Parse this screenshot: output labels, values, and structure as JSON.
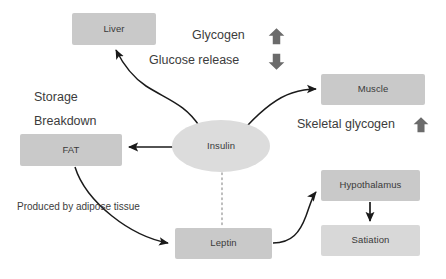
{
  "diagram": {
    "background_color": "#ffffff",
    "node_fill_medium": "#c9c9c9",
    "node_fill_light": "#d8d8d8",
    "node_fill_ellipse": "#dcdcdc",
    "edge_color": "#1a1a1a",
    "text_color": "#3a3a3a",
    "arrow_glyph_color": "#6b6b6b"
  },
  "nodes": [
    {
      "id": "liver",
      "label": "Liver",
      "shape": "box",
      "x": 72,
      "y": 13,
      "w": 84,
      "h": 32,
      "fill": "#c9c9c9"
    },
    {
      "id": "fat",
      "label": "FAT",
      "shape": "box",
      "x": 20,
      "y": 134,
      "w": 102,
      "h": 32,
      "fill": "#c9c9c9"
    },
    {
      "id": "insulin",
      "label": "Insulin",
      "shape": "ellipse",
      "x": 172,
      "y": 120,
      "w": 98,
      "h": 52,
      "fill": "#dcdcdc"
    },
    {
      "id": "muscle",
      "label": "Muscle",
      "shape": "box",
      "x": 321,
      "y": 74,
      "w": 104,
      "h": 31,
      "fill": "#c9c9c9"
    },
    {
      "id": "leptin",
      "label": "Leptin",
      "shape": "box",
      "x": 175,
      "y": 228,
      "w": 97,
      "h": 31,
      "fill": "#c9c9c9"
    },
    {
      "id": "hypothalamus",
      "label": "Hypothalamus",
      "shape": "box",
      "x": 321,
      "y": 170,
      "w": 99,
      "h": 31,
      "fill": "#c9c9c9"
    },
    {
      "id": "satiation",
      "label": "Satiation",
      "shape": "box",
      "x": 321,
      "y": 225,
      "w": 99,
      "h": 31,
      "fill": "#d8d8d8"
    }
  ],
  "labels": [
    {
      "id": "glycogen",
      "text": "Glycogen",
      "x": 192,
      "y": 29,
      "size": "normal"
    },
    {
      "id": "glucose-release",
      "text": "Glucose release",
      "x": 149,
      "y": 54,
      "size": "normal"
    },
    {
      "id": "storage",
      "text": "Storage",
      "x": 34,
      "y": 91,
      "size": "normal"
    },
    {
      "id": "breakdown",
      "text": "Breakdown",
      "x": 34,
      "y": 115,
      "size": "normal"
    },
    {
      "id": "skeletal-glycogen",
      "text": "Skeletal glycogen",
      "x": 297,
      "y": 118,
      "size": "normal"
    },
    {
      "id": "adipose-note",
      "text": "Produced by adipose tissue",
      "x": 17,
      "y": 202,
      "size": "small"
    }
  ],
  "indicator_arrows": [
    {
      "id": "glycogen-up",
      "direction": "up",
      "x": 268,
      "y": 27,
      "w": 17,
      "h": 19
    },
    {
      "id": "glucose-release-down",
      "direction": "down",
      "x": 268,
      "y": 52,
      "w": 17,
      "h": 19
    },
    {
      "id": "skeletal-glycogen-up",
      "direction": "up",
      "x": 413,
      "y": 116,
      "w": 16,
      "h": 18
    }
  ],
  "edges": [
    {
      "id": "insulin-to-liver",
      "from": "insulin",
      "to": "liver",
      "style": "curved-arrow"
    },
    {
      "id": "insulin-to-muscle",
      "from": "insulin",
      "to": "muscle",
      "style": "curved-arrow"
    },
    {
      "id": "insulin-to-fat",
      "from": "insulin",
      "to": "fat",
      "style": "straight-arrow"
    },
    {
      "id": "insulin-to-leptin",
      "from": "insulin",
      "to": "leptin",
      "style": "dotted"
    },
    {
      "id": "fat-to-leptin",
      "from": "fat",
      "to": "leptin",
      "style": "curved-arrow"
    },
    {
      "id": "leptin-to-hypothalamus",
      "from": "leptin",
      "to": "hypothalamus",
      "style": "curved-arrow"
    },
    {
      "id": "hypothalamus-to-satiation",
      "from": "hypothalamus",
      "to": "satiation",
      "style": "straight-arrow"
    }
  ]
}
